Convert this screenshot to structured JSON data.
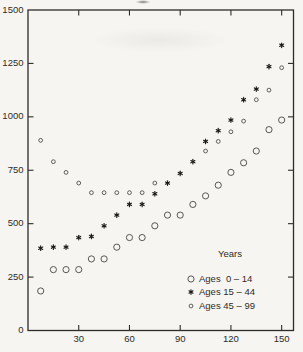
{
  "figure": {
    "background_color": "#f6f5f1",
    "ink_color": "#2e2c29",
    "marker_stroke_color": "#4a4641",
    "star_color": "#1b1a18"
  },
  "chart_data": {
    "type": "scatter",
    "title": "",
    "xlabel": "",
    "ylabel": "",
    "xlim": [
      0,
      157
    ],
    "ylim": [
      0,
      1500
    ],
    "x_tick_values": [
      30,
      60,
      90,
      120,
      150
    ],
    "y_tick_values": [
      250,
      500,
      750,
      1000,
      1250
    ],
    "y_label_values": [
      0,
      250,
      500,
      750,
      1000,
      1250,
      1500
    ],
    "grid": false,
    "x": [
      7.5,
      15,
      22.5,
      30,
      37.5,
      45,
      52.5,
      60,
      67.5,
      75,
      82.5,
      90,
      97.5,
      105,
      112.5,
      120,
      127.5,
      135,
      142.5,
      150
    ],
    "series": [
      {
        "key": "ages-0-14",
        "name": "Ages  0 – 14",
        "marker": "large-circle",
        "values": [
          185,
          285,
          285,
          285,
          335,
          335,
          390,
          435,
          435,
          490,
          540,
          540,
          590,
          630,
          680,
          740,
          785,
          840,
          940,
          985
        ]
      },
      {
        "key": "ages-15-44",
        "name": "Ages 15 – 44",
        "marker": "star",
        "values": [
          385,
          390,
          390,
          435,
          440,
          490,
          540,
          590,
          590,
          640,
          690,
          735,
          790,
          885,
          935,
          985,
          1080,
          1130,
          1235,
          1335
        ]
      },
      {
        "key": "ages-45-99",
        "name": "Ages 45 – 99",
        "marker": "small-circle",
        "values": [
          890,
          790,
          740,
          690,
          645,
          645,
          645,
          645,
          645,
          690,
          null,
          null,
          null,
          840,
          885,
          930,
          980,
          1080,
          1125,
          1230
        ]
      }
    ],
    "legend": {
      "title": "Years",
      "position": "inside-bottom-right"
    }
  }
}
